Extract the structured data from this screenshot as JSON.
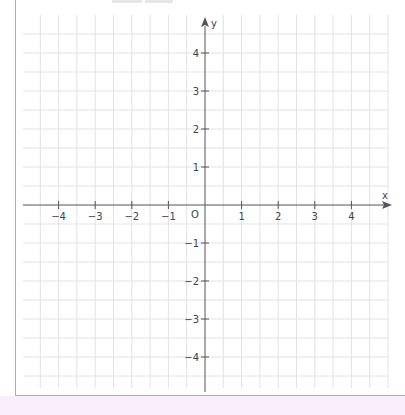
{
  "graph": {
    "origin_label": "O",
    "x_axis_label": "x",
    "y_axis_label": "y",
    "x_ticks": [
      -4,
      -3,
      -2,
      -1,
      1,
      2,
      3,
      4
    ],
    "y_ticks": [
      4,
      3,
      2,
      1,
      -1,
      -2,
      -3,
      -4
    ],
    "x_tick_labels": [
      "−4",
      "−3",
      "−2",
      "−1",
      "1",
      "2",
      "3",
      "4"
    ],
    "y_tick_labels": [
      "4",
      "3",
      "2",
      "1",
      "−1",
      "−2",
      "−3",
      "−4"
    ],
    "grid_step": 0.5,
    "x_range": [
      -5,
      5
    ],
    "y_range": [
      -5,
      5
    ],
    "colors": {
      "grid": "#e2e2e2",
      "axis": "#555555",
      "border": "#b9a9b6",
      "bottom_fill": "#fbeefb"
    }
  }
}
